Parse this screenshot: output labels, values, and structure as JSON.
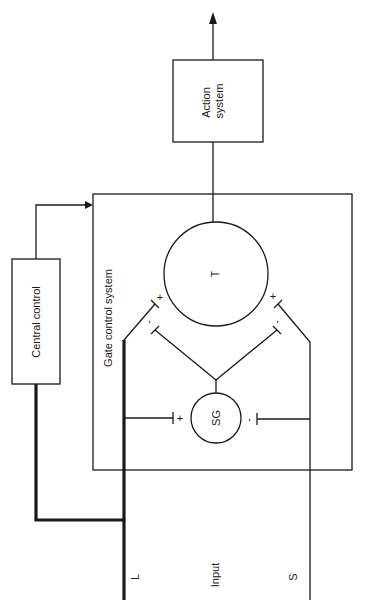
{
  "diagram": {
    "nodes": {
      "action_system": {
        "label_line1": "Action",
        "label_line2": "system"
      },
      "central_control": {
        "label": "Central control"
      },
      "gate_control_system": {
        "label": "Gate control system"
      },
      "transmission_cell": {
        "label": "T"
      },
      "substantia_gelatinosa": {
        "label": "SG"
      }
    },
    "inputs": {
      "title": "Input",
      "large_fiber": "L",
      "small_fiber": "S"
    },
    "synapse_signs": {
      "l_to_t": "+",
      "sg_to_t_left": "-",
      "s_to_t": "+",
      "sg_to_t_right": "-",
      "l_to_sg": "+",
      "s_to_sg": "-"
    },
    "colors": {
      "line": "#1a1a1a",
      "background": "#ffffff"
    }
  }
}
